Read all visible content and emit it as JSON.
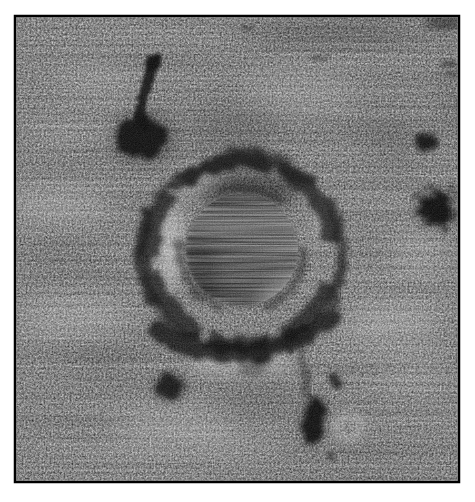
{
  "image": {
    "alt": "Noisy grayscale micrograph: a large circular crater-like structure with an irregular dark rim, a bright speckled inner halo and a smooth streaked dark central disk; a dark tadpole-shaped inclusion with a thin stem at upper left; fuzzy dark spots at the right edge, lower left and bottom center; thin black frame on white background",
    "frame": {
      "border_color": "#000000",
      "page_background": "#ffffff"
    },
    "palette": {
      "base_gray": "#8c8c8c",
      "noise_dark": "#3f3f3f",
      "noise_light": "#cfcfcf",
      "ring_dark": "#161616",
      "ring_dark_outer": "#1a1a1a",
      "halo_bright": "#e0e0e0",
      "disk_light": "#7d7d7d",
      "disk_mid": "#565656",
      "disk_dark": "#343434",
      "crescent_bright": "#c8c8c8",
      "inclusion_dark": "#0b0b0b",
      "spot_dark": "#0d0d0d",
      "donut_bright": "#d8d8d8"
    },
    "features": {
      "central_ring": {
        "cx": 242,
        "cy": 252,
        "rim_radius": 92,
        "outer_radius": 101
      },
      "central_disk": {
        "cx": 242,
        "cy": 250,
        "r": 56
      },
      "tadpole_inclusion": {
        "head_cx": 142,
        "head_cy": 138,
        "stem_top_x": 155,
        "stem_top_y": 60
      },
      "spot_right_upper": {
        "cx": 427,
        "cy": 142
      },
      "spot_right_lower": {
        "cx": 436,
        "cy": 209
      },
      "blob_lower_left": {
        "cx": 170,
        "cy": 387
      },
      "blob_bottom_elongated": {
        "cx": 313,
        "cy": 420
      },
      "spot_bottom_small": {
        "cx": 337,
        "cy": 380
      },
      "bright_donut_bottom": {
        "cx": 349,
        "cy": 427
      }
    }
  }
}
